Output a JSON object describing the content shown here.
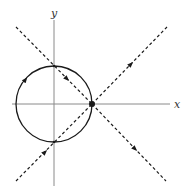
{
  "diagram": {
    "type": "phase-portrait",
    "axes": {
      "x_label": "x",
      "y_label": "y",
      "color": "#8a8a8a"
    },
    "stroke_color": "#1a1a1a",
    "circle": {
      "description": "closed orbit through saddle point, arrows indicating clockwise flow",
      "center": [
        54,
        104
      ],
      "radius": 38
    },
    "saddle_point": {
      "position": [
        92,
        104
      ],
      "label": ""
    },
    "separatrices": [
      {
        "name": "stable-upper-left",
        "from": [
          16,
          27
        ],
        "to": [
          92,
          104
        ],
        "arrow_direction": "toward-saddle"
      },
      {
        "name": "stable-lower-left",
        "from": [
          16,
          181
        ],
        "to": [
          92,
          104
        ],
        "arrow_direction": "toward-saddle"
      },
      {
        "name": "unstable-upper-right",
        "from": [
          92,
          104
        ],
        "to": [
          167,
          27
        ],
        "arrow_direction": "away-from-saddle"
      },
      {
        "name": "unstable-lower-right",
        "from": [
          92,
          104
        ],
        "to": [
          166,
          181
        ],
        "arrow_direction": "away-from-saddle"
      }
    ]
  }
}
